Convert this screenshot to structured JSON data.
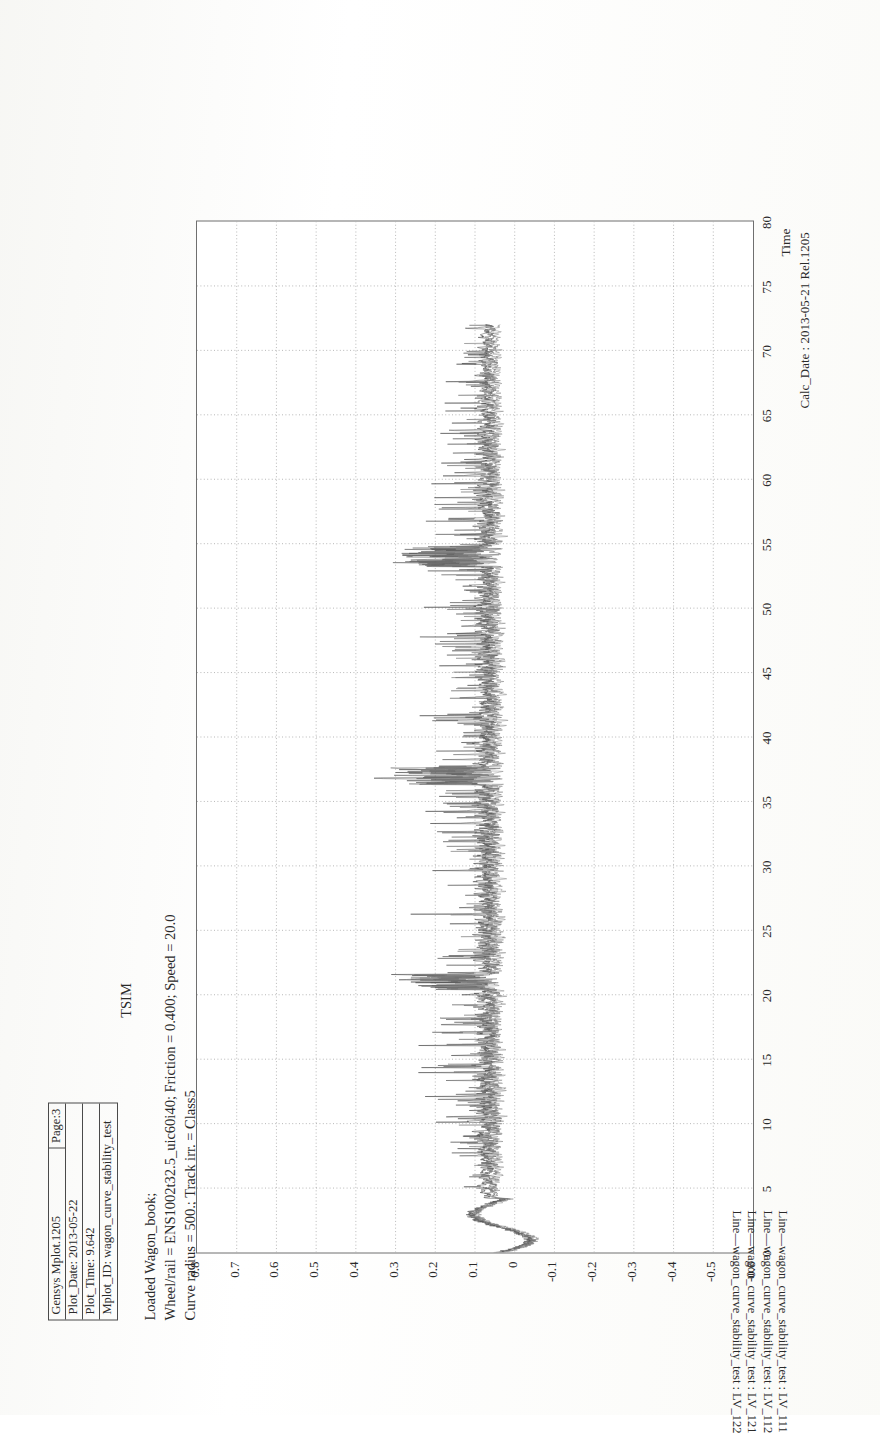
{
  "document": {
    "kind": "scanned-plot-page",
    "orientation": "landscape-rotated-90"
  },
  "infobox": {
    "rows": [
      {
        "label": "Gensys Mplot.1205",
        "right": "Page:3"
      },
      {
        "label": "Plot_Date: 2013-05-22",
        "right": ""
      },
      {
        "label": "Plot_Time: 9.642",
        "right": ""
      },
      {
        "label": "Mplot_ID: wagon_curve_stability_test",
        "right": ""
      }
    ]
  },
  "titles": {
    "center": "TSIM",
    "line1": "Loaded Wagon_book;",
    "line2": "Wheel/rail = ENS1002t32.5_uic60i40; Friction = 0.400; Speed = 20.0",
    "line3": "Curve radius = 500.; Track irr. = Class5"
  },
  "axes": {
    "x_title": "Time",
    "y_title": "",
    "calc_date": "Calc_Date : 2013-05-21 Rel.1205"
  },
  "legend": {
    "entries": [
      "Line—wagon_curve_stability_test : LV_111",
      "Line—wagon_curve_stability_test : LV_112",
      "Line—wagon_curve_stability_test : LV_121",
      "Line—wagon_curve_stability_test : LV_122"
    ]
  },
  "chart_data": {
    "type": "line",
    "title": "TSIM",
    "subtitle": "Loaded Wagon_book; Wheel/rail = ENS1002t32.5_uic60i40; Friction = 0.400; Speed = 20.0; Curve radius = 500.; Track irr. = Class5",
    "xlabel": "Time",
    "ylabel": "",
    "xlim": [
      0,
      80
    ],
    "ylim": [
      -0.6,
      0.8
    ],
    "xticks": [
      0,
      5,
      10,
      15,
      20,
      25,
      30,
      35,
      40,
      45,
      50,
      55,
      60,
      65,
      70,
      75,
      80
    ],
    "yticks": [
      0.8,
      0.7,
      0.6,
      0.5,
      0.4,
      0.3,
      0.2,
      0.1,
      0,
      -0.1,
      -0.2,
      -0.3,
      -0.4,
      -0.5,
      -0.6
    ],
    "grid": true,
    "grid_style": "dotted",
    "legend_position": "bottom-left",
    "data_time_range": [
      0,
      72
    ],
    "series": [
      {
        "name": "LV_111",
        "color": "#3a3a3a",
        "mean": 0.075,
        "noise": 0.035,
        "spike_rate": 0.1,
        "spike_max": 0.3
      },
      {
        "name": "LV_112",
        "color": "#555555",
        "mean": 0.065,
        "noise": 0.03,
        "spike_rate": 0.09,
        "spike_max": 0.26
      },
      {
        "name": "LV_121",
        "color": "#6a6a6a",
        "mean": 0.055,
        "noise": 0.028,
        "spike_rate": 0.08,
        "spike_max": 0.22
      },
      {
        "name": "LV_122",
        "color": "#808080",
        "mean": 0.045,
        "noise": 0.026,
        "spike_rate": 0.07,
        "spike_max": 0.2
      }
    ]
  }
}
